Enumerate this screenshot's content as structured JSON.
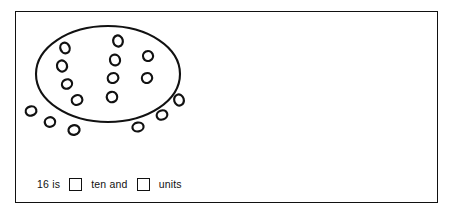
{
  "worksheet": {
    "frame": {
      "border_color": "#111111",
      "background_color": "#ffffff"
    },
    "figure": {
      "name": "counters-in-ring-diagram",
      "ring_shape": "ellipse",
      "ring_stroke_color": "#111111",
      "counter_shape": "ellipse-outline",
      "counter_stroke_color": "#111111",
      "counters_inside_count": "10",
      "counters_outside_count": "6",
      "counters_total": "16",
      "counters_inside": [
        {
          "cx": 49,
          "cy": 36,
          "rx": 4.6,
          "ry": 5.4,
          "rot": -22
        },
        {
          "cx": 46,
          "cy": 54,
          "rx": 5.0,
          "ry": 5.6,
          "rot": -18
        },
        {
          "cx": 51,
          "cy": 72,
          "rx": 5.2,
          "ry": 4.6,
          "rot": -30
        },
        {
          "cx": 61,
          "cy": 88,
          "rx": 5.4,
          "ry": 4.8,
          "rot": -25
        },
        {
          "cx": 102,
          "cy": 29,
          "rx": 4.8,
          "ry": 5.6,
          "rot": -14
        },
        {
          "cx": 99,
          "cy": 48,
          "rx": 5.0,
          "ry": 5.4,
          "rot": -16
        },
        {
          "cx": 97,
          "cy": 66,
          "rx": 5.4,
          "ry": 4.8,
          "rot": -24
        },
        {
          "cx": 96,
          "cy": 85,
          "rx": 5.2,
          "ry": 5.2,
          "rot": -20
        },
        {
          "cx": 132,
          "cy": 44,
          "rx": 5.0,
          "ry": 5.0,
          "rot": -26
        },
        {
          "cx": 131,
          "cy": 66,
          "rx": 5.2,
          "ry": 4.8,
          "rot": -24
        }
      ],
      "counters_outside": [
        {
          "cx": 15,
          "cy": 99,
          "rx": 5.4,
          "ry": 4.6,
          "rot": -16
        },
        {
          "cx": 34,
          "cy": 110,
          "rx": 5.2,
          "ry": 4.8,
          "rot": -18
        },
        {
          "cx": 58,
          "cy": 118,
          "rx": 5.6,
          "ry": 4.8,
          "rot": -14
        },
        {
          "cx": 122,
          "cy": 115,
          "rx": 5.6,
          "ry": 4.4,
          "rot": -10
        },
        {
          "cx": 146,
          "cy": 103,
          "rx": 5.4,
          "ry": 4.6,
          "rot": -20
        },
        {
          "cx": 163,
          "cy": 88,
          "rx": 4.8,
          "ry": 5.6,
          "rot": -18
        }
      ],
      "ring": {
        "cx": 92,
        "cy": 62,
        "rx": 72,
        "ry": 48
      }
    },
    "sentence": {
      "prefix": "16 is",
      "middle": "ten and",
      "suffix": "units",
      "ten_box_value": "",
      "units_box_value": ""
    }
  }
}
